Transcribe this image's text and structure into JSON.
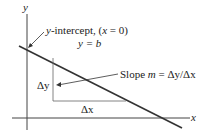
{
  "axes": {
    "x_label": "x",
    "y_label": "y"
  },
  "intercept": {
    "line1_var": "y",
    "line1_text": "-intercept, (",
    "line1_var2": "x",
    "line1_end": " = 0)",
    "line2": "y = b"
  },
  "slope": {
    "text": "Slope ",
    "m": "m",
    "eq": " = Δy/Δx"
  },
  "delta_y": "Δy",
  "delta_x": "Δx",
  "colors": {
    "line": "#333333",
    "text": "#222222"
  }
}
